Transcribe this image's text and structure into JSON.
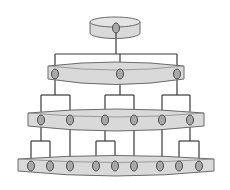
{
  "diagram": {
    "type": "hierarchical-tree",
    "colors": {
      "disc_fill": "#d9d9d9",
      "disc_stroke": "#6b6b6b",
      "node_fill": "#a8a8a8",
      "node_stroke": "#4a4a4a",
      "line": "#3a3a3a"
    },
    "levels": [
      {
        "name": "root",
        "nodes": 1
      },
      {
        "name": "level-1",
        "nodes": 3
      },
      {
        "name": "level-2",
        "nodes": 6
      },
      {
        "name": "level-3",
        "nodes": 9
      }
    ]
  }
}
